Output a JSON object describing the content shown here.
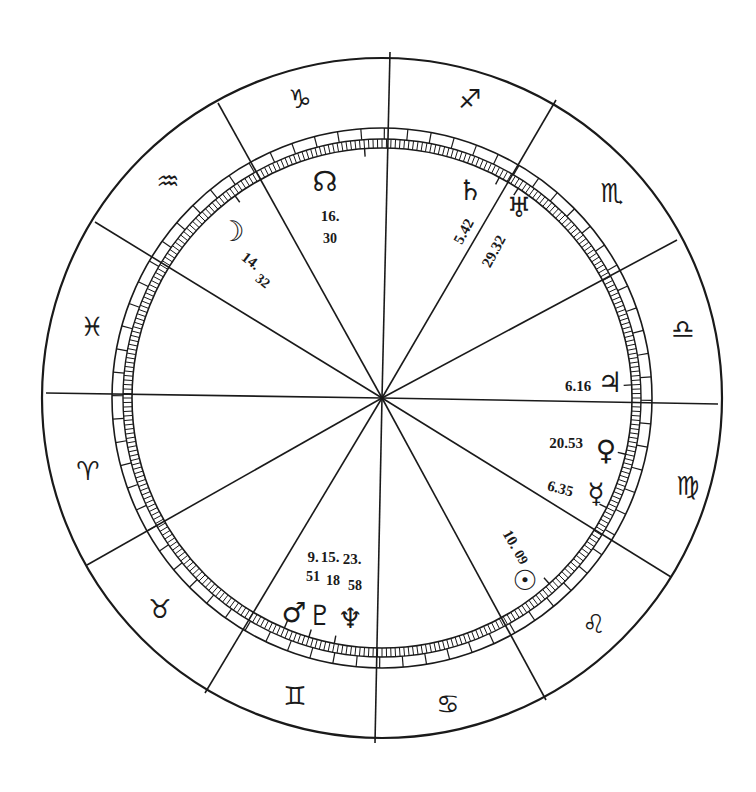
{
  "chart": {
    "type": "natal-wheel",
    "center": [
      382,
      398
    ],
    "radii": {
      "outer": 340,
      "ring_outer": 270,
      "ring_mid": 259,
      "ring_inner": 250
    },
    "line_color": "#1a1a1a",
    "background": "#ffffff",
    "house_cusp_endpoints": [
      [
        390,
        52
      ],
      [
        556,
        100
      ],
      [
        677,
        240
      ],
      [
        718,
        404
      ],
      [
        671,
        577
      ],
      [
        546,
        700
      ],
      [
        375,
        743
      ],
      [
        205,
        693
      ],
      [
        87,
        565
      ],
      [
        46,
        393
      ],
      [
        95,
        222
      ],
      [
        218,
        103
      ]
    ]
  },
  "signs": [
    {
      "name": "capricorn",
      "glyph": "♑",
      "x": 300,
      "y": 100,
      "rot": 0
    },
    {
      "name": "sagittarius",
      "glyph": "♐",
      "x": 470,
      "y": 100,
      "rot": 0
    },
    {
      "name": "scorpio",
      "glyph": "♏",
      "x": 612,
      "y": 194,
      "rot": 0
    },
    {
      "name": "libra",
      "glyph": "♎",
      "x": 683,
      "y": 330,
      "rot": 0
    },
    {
      "name": "virgo",
      "glyph": "♍",
      "x": 688,
      "y": 487,
      "rot": 0
    },
    {
      "name": "leo",
      "glyph": "♌",
      "x": 594,
      "y": 625,
      "rot": 0
    },
    {
      "name": "cancer",
      "glyph": "♋",
      "x": 448,
      "y": 705,
      "rot": 0
    },
    {
      "name": "gemini",
      "glyph": "♊",
      "x": 295,
      "y": 697,
      "rot": 0
    },
    {
      "name": "taurus",
      "glyph": "♉",
      "x": 160,
      "y": 610,
      "rot": 0
    },
    {
      "name": "aries",
      "glyph": "♈",
      "x": 88,
      "y": 472,
      "rot": 0
    },
    {
      "name": "pisces",
      "glyph": "♓",
      "x": 92,
      "y": 328,
      "rot": 0
    },
    {
      "name": "aquarius",
      "glyph": "♒",
      "x": 168,
      "y": 182,
      "rot": 0
    }
  ],
  "planets": [
    {
      "name": "north-node",
      "glyph": "☊",
      "x": 325,
      "y": 183,
      "label": "16.",
      "label2": "30",
      "lx": 330,
      "ly": 218,
      "l2x": 330,
      "l2y": 240,
      "rot": 0
    },
    {
      "name": "moon",
      "glyph": "☽",
      "x": 232,
      "y": 233,
      "label": "14.",
      "label2": "32",
      "lx": 250,
      "ly": 262,
      "l2x": 262,
      "l2y": 282,
      "rot": 38
    },
    {
      "name": "saturn",
      "glyph": "♄",
      "x": 470,
      "y": 192,
      "label": "5.42",
      "lx": 465,
      "ly": 232,
      "rot": -62
    },
    {
      "name": "uranus",
      "glyph": "♅",
      "x": 519,
      "y": 209,
      "label": "29.32",
      "lx": 495,
      "ly": 252,
      "rot": -62
    },
    {
      "name": "jupiter",
      "glyph": "♃",
      "x": 610,
      "y": 384,
      "label": "6.16",
      "lx": 578,
      "ly": 388,
      "rot": 0
    },
    {
      "name": "venus",
      "glyph": "♀",
      "x": 606,
      "y": 452,
      "label": "20.53",
      "lx": 566,
      "ly": 445,
      "rot": 0
    },
    {
      "name": "mercury",
      "glyph": "☿",
      "x": 596,
      "y": 495,
      "label": "6.35",
      "lx": 560,
      "ly": 490,
      "rot": 15
    },
    {
      "name": "sun",
      "glyph": "☉",
      "x": 525,
      "y": 582,
      "label": "10.",
      "label2": "09",
      "lx": 510,
      "ly": 540,
      "l2x": 520,
      "l2y": 558,
      "rot": 60
    },
    {
      "name": "mars",
      "glyph": "♂",
      "x": 294,
      "y": 614,
      "label": "9.",
      "label2": "51",
      "lx": 313,
      "ly": 559,
      "l2x": 313,
      "l2y": 578,
      "rot": 0
    },
    {
      "name": "pluto",
      "glyph": "♇",
      "x": 320,
      "y": 617,
      "label": "15.",
      "label2": "18",
      "lx": 330,
      "ly": 559,
      "l2x": 333,
      "l2y": 582,
      "rot": 0
    },
    {
      "name": "neptune",
      "glyph": "♆",
      "x": 350,
      "y": 620,
      "label": "23.",
      "label2": "58",
      "lx": 352,
      "ly": 561,
      "l2x": 355,
      "l2y": 587,
      "rot": 0
    }
  ],
  "planet_ticks": [
    {
      "name": "north-node-tick",
      "angle_deg": -94
    },
    {
      "name": "moon-tick",
      "angle_deg": -126
    },
    {
      "name": "saturn-tick",
      "angle_deg": -62
    },
    {
      "name": "uranus-tick",
      "angle_deg": -57
    },
    {
      "name": "jupiter-tick",
      "angle_deg": -3
    },
    {
      "name": "venus-tick",
      "angle_deg": 13
    },
    {
      "name": "mercury-tick",
      "angle_deg": 26
    },
    {
      "name": "sun-tick",
      "angle_deg": 48
    },
    {
      "name": "mars-tick",
      "angle_deg": 113
    },
    {
      "name": "pluto-tick",
      "angle_deg": 107
    },
    {
      "name": "neptune-tick",
      "angle_deg": 101
    }
  ]
}
